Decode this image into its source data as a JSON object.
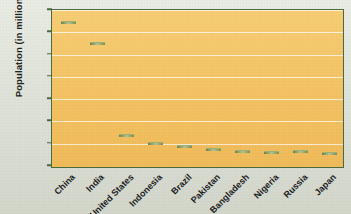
{
  "chart_data": {
    "type": "bar",
    "title": "",
    "xlabel": "",
    "ylabel": "Population (in millions)",
    "ylim": [
      0,
      1400
    ],
    "yticks": [
      "0",
      "200",
      "400",
      "600",
      "800",
      "1,000",
      "1,200",
      "1,400"
    ],
    "ytick_values": [
      0,
      200,
      400,
      600,
      800,
      1000,
      1200,
      1400
    ],
    "grid": true,
    "legend": "none",
    "categories": [
      "China",
      "India",
      "United States",
      "Indonesia",
      "Brazil",
      "Pakistan",
      "Bangladesh",
      "Nigeria",
      "Russia",
      "Japan"
    ],
    "values": [
      1300,
      1110,
      290,
      220,
      185,
      165,
      145,
      135,
      143,
      127
    ]
  },
  "colors": {
    "page_background": "#dee2d5",
    "plot_background": "#f4c263",
    "plot_border": "#4a6b40",
    "gridline": "#ffffff",
    "bar_light": "#a9b97f",
    "bar_dark": "#4e6430",
    "text": "#1d2320"
  }
}
